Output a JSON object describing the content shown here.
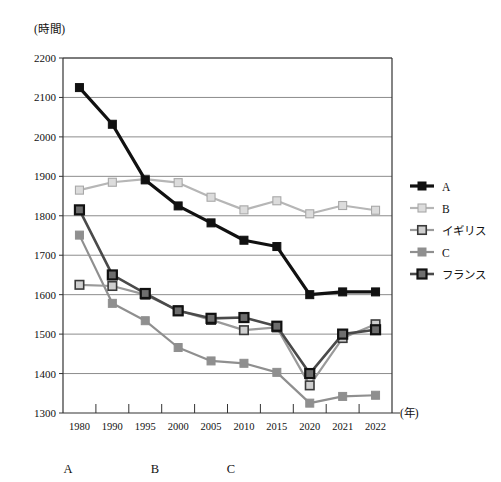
{
  "chart_data": {
    "type": "line",
    "title": "",
    "subtitle": "",
    "xlabel": "(年)",
    "ylabel": "(時間)",
    "x": [
      "1980",
      "1990",
      "1995",
      "2000",
      "2005",
      "2010",
      "2015",
      "2020",
      "2021",
      "2022"
    ],
    "categories": [
      "1980",
      "1990",
      "1995",
      "2000",
      "2005",
      "2010",
      "2015",
      "2020",
      "2021",
      "2022"
    ],
    "ylim": [
      1300,
      2200
    ],
    "yticks": [
      1300,
      1400,
      1500,
      1600,
      1700,
      1800,
      1900,
      2000,
      2100,
      2200
    ],
    "grid": true,
    "legend_position": "right",
    "series": [
      {
        "name": "A",
        "color": "#111111",
        "marker": "filled-square",
        "values": [
          2125,
          2032,
          1891,
          1825,
          1782,
          1738,
          1722,
          1600,
          1607,
          1607
        ]
      },
      {
        "name": "B",
        "color": "#b6b6b6",
        "marker": "light-square",
        "values": [
          1865,
          1885,
          1893,
          1884,
          1847,
          1815,
          1838,
          1805,
          1826,
          1814
        ]
      },
      {
        "name": "イギリス",
        "color": "#9a9a9a",
        "marker": "light-square-dark-border",
        "values": [
          1625,
          1622,
          1600,
          1560,
          1536,
          1510,
          1517,
          1370,
          1490,
          1525
        ]
      },
      {
        "name": "C",
        "color": "#8f8f8f",
        "marker": "gray-square",
        "values": [
          1751,
          1578,
          1534,
          1466,
          1432,
          1426,
          1403,
          1325,
          1342,
          1345
        ]
      },
      {
        "name": "フランス",
        "color": "#4a4a4a",
        "marker": "dark-bordered-square",
        "values": [
          1815,
          1650,
          1603,
          1559,
          1540,
          1542,
          1520,
          1400,
          1500,
          1511
        ]
      }
    ]
  },
  "legend": {
    "items": [
      {
        "label": "A"
      },
      {
        "label": "B"
      },
      {
        "label": "イギリス"
      },
      {
        "label": "C"
      },
      {
        "label": "フランス"
      }
    ]
  },
  "annotations": {
    "bottom_marks": [
      {
        "label": "A"
      },
      {
        "label": "B"
      },
      {
        "label": "C"
      }
    ]
  },
  "axes": {
    "y_unit": "(時間)",
    "x_unit": "(年)"
  }
}
